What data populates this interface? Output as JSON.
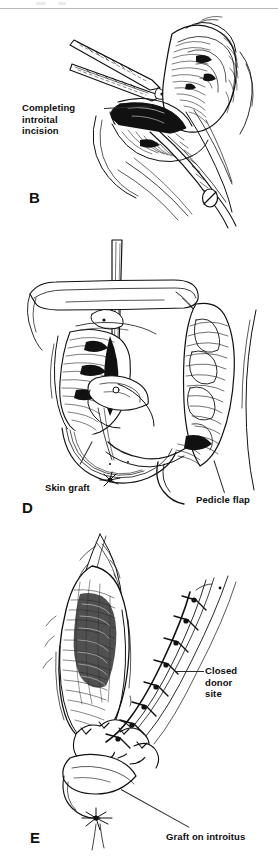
{
  "plate": {
    "background_color": "#ffffff",
    "ink_color": "#111111",
    "width": 278,
    "height": 863,
    "media": "black-and-white line-drawing surgical illustration plate"
  },
  "panels": [
    {
      "id": "panel-b",
      "letter": "B",
      "caption_lines": "Completing\nintroital\nincision",
      "subject": "Surgical scissors completing the introital incision; hatched vulvar and labial tissue with retracted flap edge and suture marker.",
      "labels": [
        {
          "name": "completing-introital-incision",
          "text": "Completing\nintroital\nincision"
        }
      ]
    },
    {
      "id": "panel-d",
      "letter": "D",
      "caption_lines": "",
      "subject": "Vertical retractor in the introitus with the skin graft inset on the left and the mobilized pedicle flap on the right.",
      "labels": [
        {
          "name": "skin-graft",
          "text": "Skin  graft"
        },
        {
          "name": "pedicle-flap",
          "text": "Pedicle flap"
        }
      ]
    },
    {
      "id": "panel-e",
      "letter": "E",
      "caption_lines": "",
      "subject": "Completed repair showing the interrupted suture line of the closed donor site and the graft seated on the introitus.",
      "labels": [
        {
          "name": "closed-donor-site",
          "text": "Closed\ndonor\nsite"
        },
        {
          "name": "graft-on-introitus",
          "text": "Graft on introitus"
        }
      ]
    }
  ]
}
